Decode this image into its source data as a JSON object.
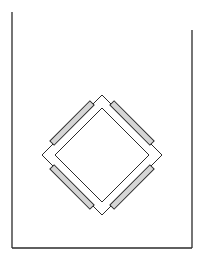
{
  "canvas": {
    "width": 205,
    "height": 258,
    "background": "#ffffff"
  },
  "colors": {
    "stroke": "#2a2a2a",
    "bar_fill": "#d6d6d6",
    "frame_fill": "#ffffff"
  },
  "container": {
    "label": "open-top container outline",
    "left_line": {
      "x": 12,
      "y1": 12,
      "y2": 248
    },
    "right_line": {
      "x": 192,
      "y1": 30,
      "y2": 248
    },
    "bottom_line": {
      "y": 248,
      "x1": 12,
      "x2": 192
    }
  },
  "diamond_frame": {
    "label": "square frame rotated 45 degrees",
    "center": {
      "x": 102,
      "y": 155
    },
    "outer_half_diagonal": 60,
    "inner_half_diagonal": 47
  },
  "bars": [
    {
      "name": "top-left-bar",
      "x1": 52,
      "y1": 143,
      "x2": 92,
      "y2": 103
    },
    {
      "name": "top-right-bar",
      "x1": 112,
      "y1": 103,
      "x2": 152,
      "y2": 143
    },
    {
      "name": "bottom-left-bar",
      "x1": 52,
      "y1": 167,
      "x2": 92,
      "y2": 207
    },
    {
      "name": "bottom-right-bar",
      "x1": 112,
      "y1": 207,
      "x2": 152,
      "y2": 167
    }
  ],
  "bar_thickness": 6
}
